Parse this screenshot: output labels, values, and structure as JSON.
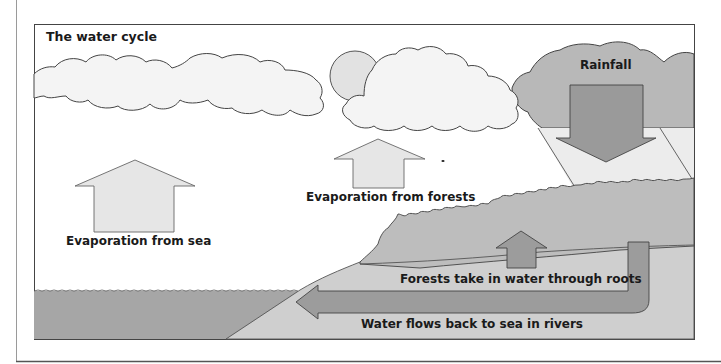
{
  "diagram": {
    "title": "The water cycle",
    "labels": {
      "rainfall": "Rainfall",
      "evaporation_sea": "Evaporation from sea",
      "evaporation_forests": "Evaporation from forests",
      "forests_roots": "Forests take in water through roots",
      "rivers": "Water flows back to sea in rivers"
    },
    "elements": [
      "sun",
      "clouds",
      "rain-cloud",
      "sea",
      "land",
      "forest",
      "rainfall-arrow",
      "evaporation-sea-arrow",
      "evaporation-forests-arrow",
      "roots-arrow",
      "river-arrow"
    ],
    "colors": {
      "background": "#ffffff",
      "cloud_fill": "#f4f4f4",
      "sun_fill": "#e2e2e2",
      "rain_cloud_fill": "#b8b8b8",
      "rainfall_arrow": "#9a9a9a",
      "rain_shaft": "#ececec",
      "sea": "#a6a6a6",
      "land": "#cfcfcf",
      "forest": "#bdbdbd",
      "river": "#9c9c9c",
      "light_arrow": "#e6e6e6",
      "outline": "#555555",
      "text": "#1a1a1a"
    }
  }
}
